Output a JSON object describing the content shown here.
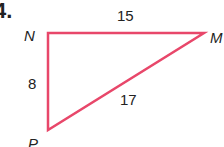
{
  "problem": {
    "number": "4."
  },
  "diagram": {
    "type": "right-triangle",
    "stroke_color": "#e8476a",
    "vertices": [
      {
        "name": "N",
        "x": 48,
        "y": 33
      },
      {
        "name": "M",
        "x": 204,
        "y": 33
      },
      {
        "name": "P",
        "x": 48,
        "y": 130
      }
    ],
    "sides": [
      {
        "from": "N",
        "to": "M",
        "length": "15"
      },
      {
        "from": "N",
        "to": "P",
        "length": "8"
      },
      {
        "from": "P",
        "to": "M",
        "length": "17"
      }
    ],
    "labels": {
      "N": "N",
      "M": "M",
      "P": "P",
      "NM": "15",
      "NP": "8",
      "PM": "17"
    }
  }
}
